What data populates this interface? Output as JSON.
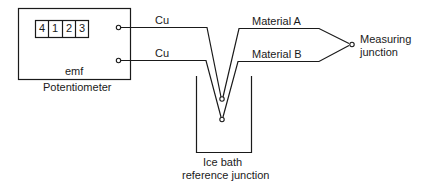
{
  "diagram": {
    "type": "thermocouple-circuit",
    "colors": {
      "stroke": "#1a1a1a",
      "background": "#ffffff"
    },
    "potentiometer": {
      "label": "Potentiometer",
      "inner_label": "emf",
      "display_digits": [
        "4",
        "1",
        "2",
        "3"
      ]
    },
    "wires": {
      "upper_lead": "Cu",
      "lower_lead": "Cu",
      "material_a": "Material A",
      "material_b": "Material B"
    },
    "measuring_junction": {
      "line1": "Measuring",
      "line2": "junction"
    },
    "ice_bath": {
      "line1": "Ice bath",
      "line2": "reference junction"
    }
  }
}
